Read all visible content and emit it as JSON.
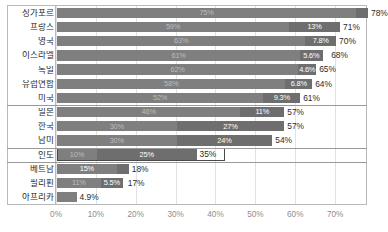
{
  "chart_data": {
    "type": "bar",
    "orientation": "horizontal",
    "stacked": true,
    "title": "",
    "xlabel": "",
    "ylabel": "",
    "xlim": [
      0,
      78
    ],
    "axis_max_pct": 78,
    "grid": true,
    "legend": "none",
    "ticks": [
      "0%",
      "10%",
      "20%",
      "30%",
      "40%",
      "50%",
      "60%",
      "70%"
    ],
    "tick_values": [
      0,
      10,
      20,
      30,
      40,
      50,
      60,
      70
    ],
    "categories": [
      "싱가포르",
      "프랑스",
      "영국",
      "이스라엘",
      "독일",
      "유럽연합",
      "미국",
      "일본",
      "한국",
      "남미",
      "인도",
      "베트남",
      "필리핀",
      "아프리카"
    ],
    "series": [
      {
        "name": "segment-1",
        "values": [
          75,
          59,
          63,
          61,
          62,
          58,
          52,
          46,
          30,
          30,
          10,
          15,
          11,
          4.9
        ]
      },
      {
        "name": "segment-2",
        "values": [
          3,
          13,
          7.8,
          5.6,
          4.6,
          6.8,
          9.3,
          11,
          27,
          24,
          25,
          3,
          5.5,
          0
        ]
      }
    ],
    "totals": [
      78,
      71,
      70,
      68,
      65,
      64,
      61,
      57,
      57,
      54,
      35,
      18,
      17,
      4.9
    ],
    "rows": [
      {
        "label": "싱가포르",
        "seg1": 75,
        "seg1_label": "75%",
        "seg1_label_visible": true,
        "seg1_label_dim": true,
        "seg2": 3,
        "seg2_label": "",
        "seg2_label_visible": false,
        "total": 78,
        "total_label": "78%",
        "group": 1,
        "highlight": false
      },
      {
        "label": "프랑스",
        "seg1": 59,
        "seg1_label": "59%",
        "seg1_label_visible": true,
        "seg1_label_dim": true,
        "seg2": 13,
        "seg2_label": "13%",
        "seg2_label_visible": true,
        "total": 71,
        "total_label": "71%",
        "group": 1,
        "highlight": false
      },
      {
        "label": "영국",
        "seg1": 63,
        "seg1_label": "63%",
        "seg1_label_visible": true,
        "seg1_label_dim": true,
        "seg2": 7.8,
        "seg2_label": "7.8%",
        "seg2_label_visible": true,
        "total": 70,
        "total_label": "70%",
        "group": 1,
        "highlight": false
      },
      {
        "label": "이스라엘",
        "seg1": 61,
        "seg1_label": "61%",
        "seg1_label_visible": true,
        "seg1_label_dim": true,
        "seg2": 5.6,
        "seg2_label": "5.6%",
        "seg2_label_visible": true,
        "total": 68,
        "total_label": "68%",
        "group": 1,
        "highlight": false
      },
      {
        "label": "독일",
        "seg1": 62,
        "seg1_label": "62%",
        "seg1_label_visible": true,
        "seg1_label_dim": true,
        "seg2": 4.6,
        "seg2_label": "4.6%",
        "seg2_label_visible": true,
        "total": 65,
        "total_label": "65%",
        "group": 1,
        "highlight": false
      },
      {
        "label": "유럽연합",
        "seg1": 58,
        "seg1_label": "58%",
        "seg1_label_visible": true,
        "seg1_label_dim": true,
        "seg2": 6.8,
        "seg2_label": "6.8%",
        "seg2_label_visible": true,
        "total": 64,
        "total_label": "64%",
        "group": 1,
        "highlight": false
      },
      {
        "label": "미국",
        "seg1": 52,
        "seg1_label": "52%",
        "seg1_label_visible": true,
        "seg1_label_dim": true,
        "seg2": 9.3,
        "seg2_label": "9.3%",
        "seg2_label_visible": true,
        "total": 61,
        "total_label": "61%",
        "group": 1,
        "highlight": false
      },
      {
        "label": "일본",
        "seg1": 46,
        "seg1_label": "46%",
        "seg1_label_visible": true,
        "seg1_label_dim": true,
        "seg2": 11,
        "seg2_label": "11%",
        "seg2_label_visible": true,
        "total": 57,
        "total_label": "57%",
        "group": 2,
        "highlight": false
      },
      {
        "label": "한국",
        "seg1": 30,
        "seg1_label": "30%",
        "seg1_label_visible": true,
        "seg1_label_dim": true,
        "seg2": 27,
        "seg2_label": "27%",
        "seg2_label_visible": true,
        "total": 57,
        "total_label": "57%",
        "group": 2,
        "highlight": false
      },
      {
        "label": "남미",
        "seg1": 30,
        "seg1_label": "30%",
        "seg1_label_visible": true,
        "seg1_label_dim": true,
        "seg2": 24,
        "seg2_label": "24%",
        "seg2_label_visible": true,
        "total": 54,
        "total_label": "54%",
        "group": 2,
        "highlight": false
      },
      {
        "label": "인도",
        "seg1": 10,
        "seg1_label": "10%",
        "seg1_label_visible": true,
        "seg1_label_dim": true,
        "seg2": 25,
        "seg2_label": "25%",
        "seg2_label_visible": true,
        "total": 35,
        "total_label": "35%",
        "group": 3,
        "highlight": true
      },
      {
        "label": "베트남",
        "seg1": 15,
        "seg1_label": "15%",
        "seg1_label_visible": true,
        "seg1_label_dim": false,
        "seg2": 3,
        "seg2_label": "",
        "seg2_label_visible": false,
        "total": 18,
        "total_label": "18%",
        "group": 4,
        "highlight": false
      },
      {
        "label": "필리핀",
        "seg1": 11,
        "seg1_label": "11%",
        "seg1_label_visible": true,
        "seg1_label_dim": true,
        "seg2": 5.5,
        "seg2_label": "5.5%",
        "seg2_label_visible": true,
        "total": 17,
        "total_label": "17%",
        "group": 4,
        "highlight": false
      },
      {
        "label": "아프리카",
        "seg1": 4.9,
        "seg1_label": "",
        "seg1_label_visible": false,
        "seg2": 0,
        "seg2_label": "",
        "seg2_label_visible": false,
        "total": 4.9,
        "total_label": "4.9%",
        "group": 4,
        "highlight": false
      }
    ],
    "colors": {
      "segment_1": "#7f7f7f",
      "segment_2": "#6e6e6e",
      "grid": "#e2e2e2",
      "frame": "#b9b9b9",
      "group_separator": "#9a9a9a",
      "label_text": "#2b2b2b",
      "tick_text": "#8e8e8e",
      "bar_value_text": "#ffffff",
      "highlight_outline": "#4a4a4a"
    }
  }
}
